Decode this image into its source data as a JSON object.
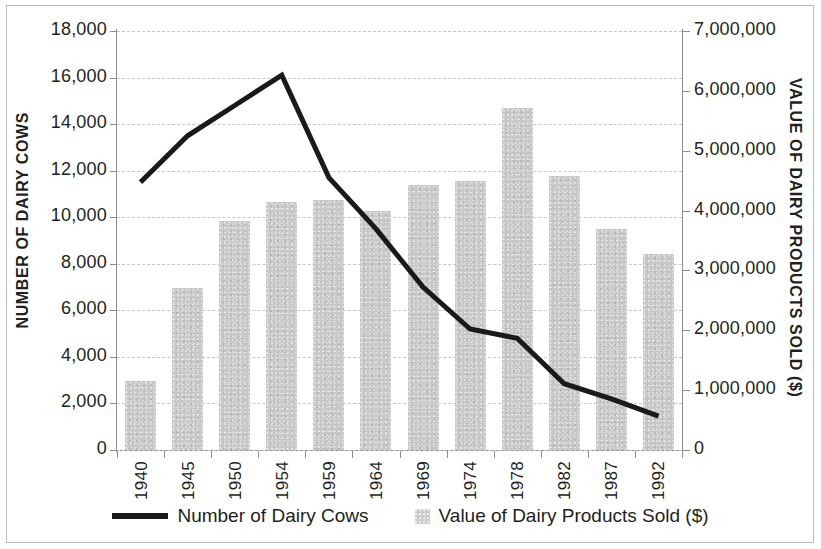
{
  "chart_data": {
    "type": "bar",
    "title": "",
    "xlabel": "",
    "categories": [
      "1940",
      "1945",
      "1950",
      "1954",
      "1959",
      "1964",
      "1969",
      "1974",
      "1978",
      "1982",
      "1987",
      "1992"
    ],
    "series": [
      {
        "name": "Number of Dairy Cows",
        "type": "line",
        "axis": "left",
        "color": "#1a1a1a",
        "values": [
          11500,
          13500,
          14800,
          16100,
          11700,
          9500,
          7000,
          5200,
          4800,
          2850,
          2200,
          1450
        ]
      },
      {
        "name": "Value of Dairy Products Sold ($)",
        "type": "bar",
        "axis": "right",
        "color": "#c8c8c8",
        "values": [
          1150000,
          2700000,
          3830000,
          4150000,
          4180000,
          4000000,
          4430000,
          4500000,
          5720000,
          4580000,
          3700000,
          3270000
        ]
      }
    ],
    "left_axis": {
      "label": "NUMBER OF DAIRY COWS",
      "ticks": [
        "0",
        "2,000",
        "4,000",
        "6,000",
        "8,000",
        "10,000",
        "12,000",
        "14,000",
        "16,000",
        "18,000"
      ],
      "tick_values": [
        0,
        2000,
        4000,
        6000,
        8000,
        10000,
        12000,
        14000,
        16000,
        18000
      ],
      "min": 0,
      "max": 18000
    },
    "right_axis": {
      "label": "VALUE OF DAIRY PRODUCTS SOLD ($)",
      "ticks": [
        "0",
        "1,000,000",
        "2,000,000",
        "3,000,000",
        "4,000,000",
        "5,000,000",
        "6,000,000",
        "7,000,000"
      ],
      "tick_values": [
        0,
        1000000,
        2000000,
        3000000,
        4000000,
        5000000,
        6000000,
        7000000
      ],
      "min": 0,
      "max": 7000000
    },
    "grid": true,
    "legend_position": "bottom",
    "legend": [
      {
        "label": "Number of Dairy Cows",
        "marker": "line",
        "color": "#1a1a1a"
      },
      {
        "label": "Value of Dairy Products Sold ($)",
        "marker": "square",
        "color": "#c8c8c8"
      }
    ]
  }
}
